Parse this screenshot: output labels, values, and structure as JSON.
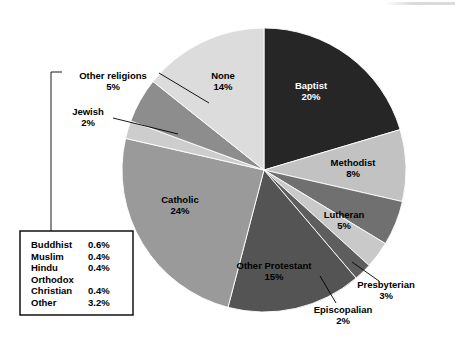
{
  "chart_data": {
    "type": "pie",
    "title": "",
    "subtitle": "",
    "xlabel": "",
    "ylabel": "",
    "legend_position": "bottom-left-box",
    "start_angle_deg": 0,
    "direction": "clockwise",
    "units": "percent",
    "categories": [
      "Baptist",
      "Methodist",
      "Lutheran",
      "Presbyterian",
      "Episcopalian",
      "Other Protestant",
      "Catholic",
      "Jewish",
      "Other religions",
      "None"
    ],
    "values": [
      20,
      8,
      5,
      3,
      2,
      15,
      24,
      2,
      5,
      14
    ],
    "slices": [
      {
        "name": "Baptist",
        "value": 20,
        "value_label": "20%",
        "color": "#262626",
        "label_style": "inside-light",
        "label_x": 311,
        "label_y": 89
      },
      {
        "name": "Methodist",
        "value": 8,
        "value_label": "8%",
        "color": "#c2c2c2",
        "label_style": "inside-dark",
        "label_x": 353,
        "label_y": 166
      },
      {
        "name": "Lutheran",
        "value": 5,
        "value_label": "5%",
        "color": "#707070",
        "label_style": "inside-dark",
        "label_x": 344,
        "label_y": 218
      },
      {
        "name": "Presbyterian",
        "value": 3,
        "value_label": "3%",
        "color": "#c9c9c9",
        "label_style": "callout-right",
        "label_x": 386,
        "label_y": 288
      },
      {
        "name": "Episcopalian",
        "value": 2,
        "value_label": "2%",
        "color": "#5e5e5e",
        "label_style": "callout-right",
        "label_x": 343,
        "label_y": 313
      },
      {
        "name": "Other Protestant",
        "value": 15,
        "value_label": "15%",
        "color": "#545454",
        "label_style": "inside-dark",
        "label_x": 274,
        "label_y": 269
      },
      {
        "name": "Catholic",
        "value": 24,
        "value_label": "24%",
        "color": "#9a9a9a",
        "label_style": "inside-dark",
        "label_x": 180,
        "label_y": 203
      },
      {
        "name": "Jewish",
        "value": 2,
        "value_label": "2%",
        "color": "#cdcdcd",
        "label_style": "callout-left",
        "label_x": 88,
        "label_y": 115
      },
      {
        "name": "Other religions",
        "value": 5,
        "value_label": "5%",
        "color": "#8d8d8d",
        "label_style": "callout-left",
        "label_x": 113,
        "label_y": 79
      },
      {
        "name": "None",
        "value": 14,
        "value_label": "14%",
        "color": "#dcdcdc",
        "label_style": "inside-dark",
        "label_x": 223,
        "label_y": 79
      }
    ],
    "breakout_legend": {
      "title": "",
      "linked_to": "Other religions",
      "rows": [
        {
          "name": "Buddhist",
          "value_label": "0.6%",
          "value": 0.6
        },
        {
          "name": "Muslim",
          "value_label": "0.4%",
          "value": 0.4
        },
        {
          "name": "Hindu",
          "value_label": "0.4%",
          "value": 0.4
        },
        {
          "name": "Orthodox",
          "value_label": "",
          "value": null
        },
        {
          "name": "Christian",
          "value_label": "0.4%",
          "value": 0.4
        },
        {
          "name": "Other",
          "value_label": "3.2%",
          "value": 3.2
        }
      ]
    },
    "geometry": {
      "center_x": 264,
      "center_y": 170,
      "radius": 142
    },
    "colors": {
      "background": "#ffffff",
      "text": "#000000",
      "inverse_text": "#ffffff",
      "leader_line": "#000000"
    }
  }
}
